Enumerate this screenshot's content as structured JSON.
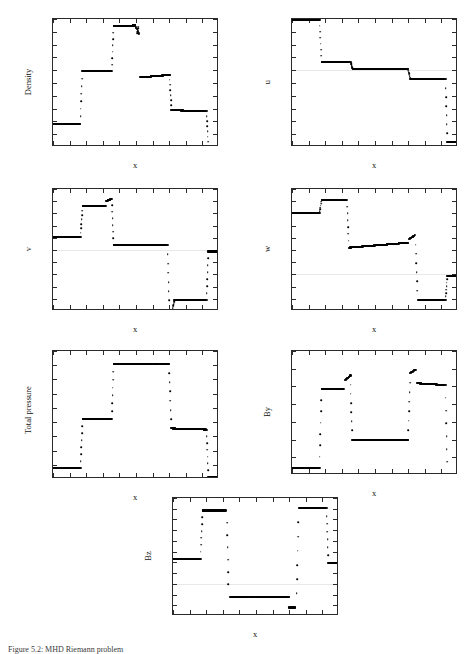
{
  "figure": {
    "caption": "Figure 5.2: MHD Riemann problem",
    "x_axis_title": "x",
    "x_ticks": [
      "0",
      "0.1",
      "0.2",
      "0.3",
      "0.4",
      "0.5",
      "0.6",
      "0.7",
      "0.8",
      "0.9",
      "1"
    ],
    "x_tick_values": [
      0,
      0.1,
      0.2,
      0.3,
      0.4,
      0.5,
      0.6,
      0.7,
      0.8,
      0.9,
      1
    ],
    "marker_color": "#000000",
    "axis_color": "#2a2a2a"
  },
  "chart_data": [
    {
      "type": "scatter",
      "id": "density",
      "title": "",
      "xlabel": "x",
      "ylabel": "Density",
      "xlim": [
        0,
        1
      ],
      "ylim": [
        0.1,
        0.6
      ],
      "yticks": [
        0.1,
        0.15,
        0.2,
        0.25,
        0.3,
        0.35,
        0.4,
        0.45,
        0.5,
        0.55,
        0.6
      ],
      "ytick_labels": [
        "0.1",
        "0.15",
        "0.2",
        "0.25",
        "0.3",
        "0.35",
        "0.4",
        "0.45",
        "0.5",
        "0.55",
        "0.6"
      ],
      "grid": false,
      "legend": "none",
      "segments": [
        {
          "x0": 0.0,
          "x1": 0.165,
          "y0": 0.19,
          "y1": 0.19
        },
        {
          "x0": 0.175,
          "x1": 0.355,
          "y0": 0.397,
          "y1": 0.397
        },
        {
          "x0": 0.365,
          "x1": 0.495,
          "y0": 0.572,
          "y1": 0.575
        },
        {
          "x0": 0.495,
          "x1": 0.52,
          "y0": 0.575,
          "y1": 0.54
        },
        {
          "x0": 0.525,
          "x1": 0.705,
          "y0": 0.372,
          "y1": 0.382
        },
        {
          "x0": 0.712,
          "x1": 0.925,
          "y0": 0.244,
          "y1": 0.24
        },
        {
          "x0": 0.935,
          "x1": 1.0,
          "y0": 0.101,
          "y1": 0.101
        }
      ],
      "transition_x": [
        0.17,
        0.36,
        0.51,
        0.708,
        0.93
      ]
    },
    {
      "type": "scatter",
      "id": "u",
      "title": "",
      "xlabel": "x",
      "ylabel": "u",
      "xlim": [
        0,
        1
      ],
      "ylim": [
        -6,
        4
      ],
      "yticks": [
        -6,
        -5,
        -4,
        -3,
        -2,
        -1,
        0,
        1,
        2,
        3,
        4
      ],
      "ytick_labels": [
        "-6",
        "-5",
        "-4",
        "-3",
        "-2",
        "-1",
        "0",
        "1",
        "2",
        "3",
        "4"
      ],
      "grid": false,
      "legend": "none",
      "segments": [
        {
          "x0": 0.0,
          "x1": 0.168,
          "y0": 3.95,
          "y1": 3.95
        },
        {
          "x0": 0.178,
          "x1": 0.355,
          "y0": 0.65,
          "y1": 0.62
        },
        {
          "x0": 0.365,
          "x1": 0.7,
          "y0": 0.1,
          "y1": 0.08
        },
        {
          "x0": 0.712,
          "x1": 0.925,
          "y0": -0.68,
          "y1": -0.68
        },
        {
          "x0": 0.935,
          "x1": 1.0,
          "y0": -5.62,
          "y1": -5.62
        }
      ],
      "transition_x": [
        0.172,
        0.36,
        0.706,
        0.93
      ]
    },
    {
      "type": "scatter",
      "id": "v",
      "title": "",
      "xlabel": "x",
      "ylabel": "v",
      "xlim": [
        0,
        1
      ],
      "ylim": [
        -2.5,
        2.5
      ],
      "yticks": [
        -2.5,
        -2,
        -1.5,
        -1,
        -0.5,
        0,
        0.5,
        1,
        1.5,
        2,
        2.5
      ],
      "ytick_labels": [
        "-2.5",
        "-2",
        "-1.5",
        "-1",
        "-0.5",
        "0",
        "0.5",
        "1",
        "1.5",
        "2",
        "2.5"
      ],
      "grid": false,
      "legend": "none",
      "segments": [
        {
          "x0": 0.0,
          "x1": 0.168,
          "y0": 0.52,
          "y1": 0.52
        },
        {
          "x0": 0.178,
          "x1": 0.318,
          "y0": 1.8,
          "y1": 1.8
        },
        {
          "x0": 0.32,
          "x1": 0.355,
          "y0": 2.0,
          "y1": 2.1
        },
        {
          "x0": 0.365,
          "x1": 0.69,
          "y0": 0.22,
          "y1": 0.2
        },
        {
          "x0": 0.7,
          "x1": 0.722,
          "y0": -2.44,
          "y1": -2.44
        },
        {
          "x0": 0.73,
          "x1": 0.925,
          "y0": -2.05,
          "y1": -2.05
        },
        {
          "x0": 0.935,
          "x1": 1.0,
          "y0": -0.06,
          "y1": -0.06
        }
      ],
      "transition_x": [
        0.172,
        0.36,
        0.695,
        0.726,
        0.93
      ]
    },
    {
      "type": "scatter",
      "id": "w",
      "title": "",
      "xlabel": "x",
      "ylabel": "w",
      "xlim": [
        0,
        1
      ],
      "ylim": [
        -1.5,
        3.5
      ],
      "yticks": [
        -1.5,
        -1,
        -0.5,
        0,
        0.5,
        1,
        1.5,
        2,
        2.5,
        3,
        3.5
      ],
      "ytick_labels": [
        "-1.5",
        "-1",
        "-0.5",
        "0",
        "0.5",
        "1",
        "1.5",
        "2",
        "2.5",
        "3",
        "3.5"
      ],
      "grid": false,
      "legend": "none",
      "segments": [
        {
          "x0": 0.0,
          "x1": 0.168,
          "y0": 2.5,
          "y1": 2.5
        },
        {
          "x0": 0.178,
          "x1": 0.33,
          "y0": 3.06,
          "y1": 3.06
        },
        {
          "x0": 0.345,
          "x1": 0.7,
          "y0": 1.1,
          "y1": 1.3
        },
        {
          "x0": 0.705,
          "x1": 0.74,
          "y0": 1.45,
          "y1": 1.6
        },
        {
          "x0": 0.762,
          "x1": 0.925,
          "y0": -1.04,
          "y1": -1.04
        },
        {
          "x0": 0.935,
          "x1": 1.0,
          "y0": -0.06,
          "y1": -0.06
        }
      ],
      "transition_x": [
        0.172,
        0.337,
        0.75,
        0.93
      ]
    },
    {
      "type": "scatter",
      "id": "total_pressure",
      "title": "",
      "xlabel": "x",
      "ylabel": "Total pressure",
      "xlim": [
        0,
        1
      ],
      "ylim": [
        0,
        4.5
      ],
      "yticks": [
        0,
        0.5,
        1,
        1.5,
        2,
        2.5,
        3,
        3.5,
        4,
        4.5
      ],
      "ytick_labels": [
        "0",
        "0.5",
        "1",
        "1.5",
        "2",
        "2.5",
        "3",
        "3.5",
        "4",
        "4.5"
      ],
      "grid": false,
      "legend": "none",
      "segments": [
        {
          "x0": 0.0,
          "x1": 0.168,
          "y0": 0.38,
          "y1": 0.38
        },
        {
          "x0": 0.178,
          "x1": 0.355,
          "y0": 2.1,
          "y1": 2.1
        },
        {
          "x0": 0.365,
          "x1": 0.7,
          "y0": 4.05,
          "y1": 4.05
        },
        {
          "x0": 0.712,
          "x1": 0.925,
          "y0": 1.78,
          "y1": 1.74
        },
        {
          "x0": 0.935,
          "x1": 1.0,
          "y0": 0.07,
          "y1": 0.07
        }
      ],
      "transition_x": [
        0.172,
        0.36,
        0.706,
        0.93
      ]
    },
    {
      "type": "scatter",
      "id": "by",
      "title": "",
      "xlabel": "x",
      "ylabel": "By",
      "xlim": [
        0,
        1
      ],
      "ylim": [
        2,
        9
      ],
      "yticks": [
        2,
        3,
        4,
        5,
        6,
        7,
        8,
        9
      ],
      "ytick_labels": [
        "2",
        "3",
        "4",
        "5",
        "6",
        "7",
        "8",
        "9"
      ],
      "grid": false,
      "legend": "none",
      "segments": [
        {
          "x0": 0.0,
          "x1": 0.168,
          "y0": 2.38,
          "y1": 2.38
        },
        {
          "x0": 0.178,
          "x1": 0.31,
          "y0": 6.88,
          "y1": 6.88
        },
        {
          "x0": 0.32,
          "x1": 0.352,
          "y0": 7.35,
          "y1": 7.62
        },
        {
          "x0": 0.363,
          "x1": 0.7,
          "y0": 4.0,
          "y1": 4.0
        },
        {
          "x0": 0.712,
          "x1": 0.745,
          "y0": 7.75,
          "y1": 7.95
        },
        {
          "x0": 0.755,
          "x1": 0.925,
          "y0": 7.18,
          "y1": 7.08
        },
        {
          "x0": 0.935,
          "x1": 1.0,
          "y0": 2.03,
          "y1": 2.03
        }
      ],
      "transition_x": [
        0.172,
        0.357,
        0.706,
        0.93
      ]
    },
    {
      "type": "scatter",
      "id": "bz",
      "title": "",
      "xlabel": "x",
      "ylabel": "Bz",
      "xlim": [
        0,
        1
      ],
      "ylim": [
        -1.5,
        4
      ],
      "yticks": [
        -1.5,
        -1,
        -0.5,
        0,
        0.5,
        1,
        1.5,
        2,
        2.5,
        3,
        3.5,
        4
      ],
      "ytick_labels": [
        "-1.5",
        "-1",
        "-0.5",
        "0",
        "0.5",
        "1",
        "1.5",
        "2",
        "2.5",
        "3",
        "3.5",
        "4"
      ],
      "grid": false,
      "legend": "none",
      "segments": [
        {
          "x0": 0.0,
          "x1": 0.168,
          "y0": 1.18,
          "y1": 1.18
        },
        {
          "x0": 0.18,
          "x1": 0.318,
          "y0": 3.42,
          "y1": 3.42
        },
        {
          "x0": 0.345,
          "x1": 0.7,
          "y0": -0.6,
          "y1": -0.6
        },
        {
          "x0": 0.7,
          "x1": 0.735,
          "y0": -1.1,
          "y1": -1.1
        },
        {
          "x0": 0.762,
          "x1": 0.925,
          "y0": 3.52,
          "y1": 3.52
        },
        {
          "x0": 0.935,
          "x1": 1.0,
          "y0": 0.98,
          "y1": 0.98
        }
      ],
      "transition_x": [
        0.172,
        0.33,
        0.75,
        0.93
      ]
    }
  ]
}
